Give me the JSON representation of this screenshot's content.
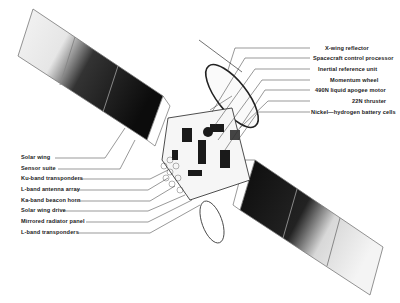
{
  "diagram": {
    "colors": {
      "ink": "#1a1a1a",
      "panel_dark": "#111111",
      "panel_light": "#f2f2f2",
      "background": "#ffffff"
    },
    "labels_right": [
      {
        "text": "X-wing reflector",
        "y": 46
      },
      {
        "text": "Spacecraft control processor",
        "y": 56
      },
      {
        "text": "Inertial reference unit",
        "y": 67
      },
      {
        "text": "Momentum wheel",
        "y": 78
      },
      {
        "text": "490N liquid apogee motor",
        "y": 88
      },
      {
        "text": "22N thruster",
        "y": 99
      },
      {
        "text": "Nickel—hydrogen battery cells",
        "y": 110
      }
    ],
    "labels_left": [
      {
        "text": "Solar wing",
        "y": 155
      },
      {
        "text": "Sensor suite",
        "y": 166
      },
      {
        "text": "Ku-band transponders",
        "y": 176
      },
      {
        "text": "L-band antenna array",
        "y": 187
      },
      {
        "text": "Ka-band beacon horn",
        "y": 198
      },
      {
        "text": "Solar wing drive",
        "y": 208
      },
      {
        "text": "Mirrored radiator panel",
        "y": 219
      },
      {
        "text": "L-band transponders",
        "y": 230
      }
    ]
  }
}
